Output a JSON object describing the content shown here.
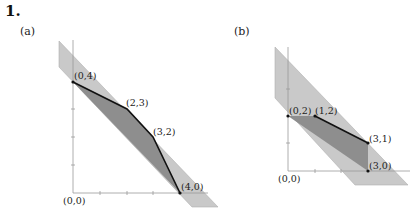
{
  "problem_number": "1.",
  "colors": {
    "band": "#c9c9c9",
    "band_edge": "#a8a8a8",
    "polytope": "#8e8e8e",
    "edge": "#111111",
    "axis": "#9a9a9a"
  },
  "panels": [
    {
      "label": "(a)",
      "origin_label": "(0,0)",
      "vertices": [
        {
          "label": "(0,4)",
          "x": 0,
          "y": 4
        },
        {
          "label": "(2,3)",
          "x": 2,
          "y": 3
        },
        {
          "label": "(3,2)",
          "x": 3,
          "y": 2
        },
        {
          "label": "(4,0)",
          "x": 4,
          "y": 0
        }
      ]
    },
    {
      "label": "(b)",
      "origin_label": "(0,0)",
      "vertices": [
        {
          "label": "(0,2)",
          "x": 0,
          "y": 2
        },
        {
          "label": "(1,2)",
          "x": 1,
          "y": 2
        },
        {
          "label": "(3,1)",
          "x": 3,
          "y": 1
        },
        {
          "label": "(3,0)",
          "x": 3,
          "y": 0
        }
      ]
    }
  ]
}
